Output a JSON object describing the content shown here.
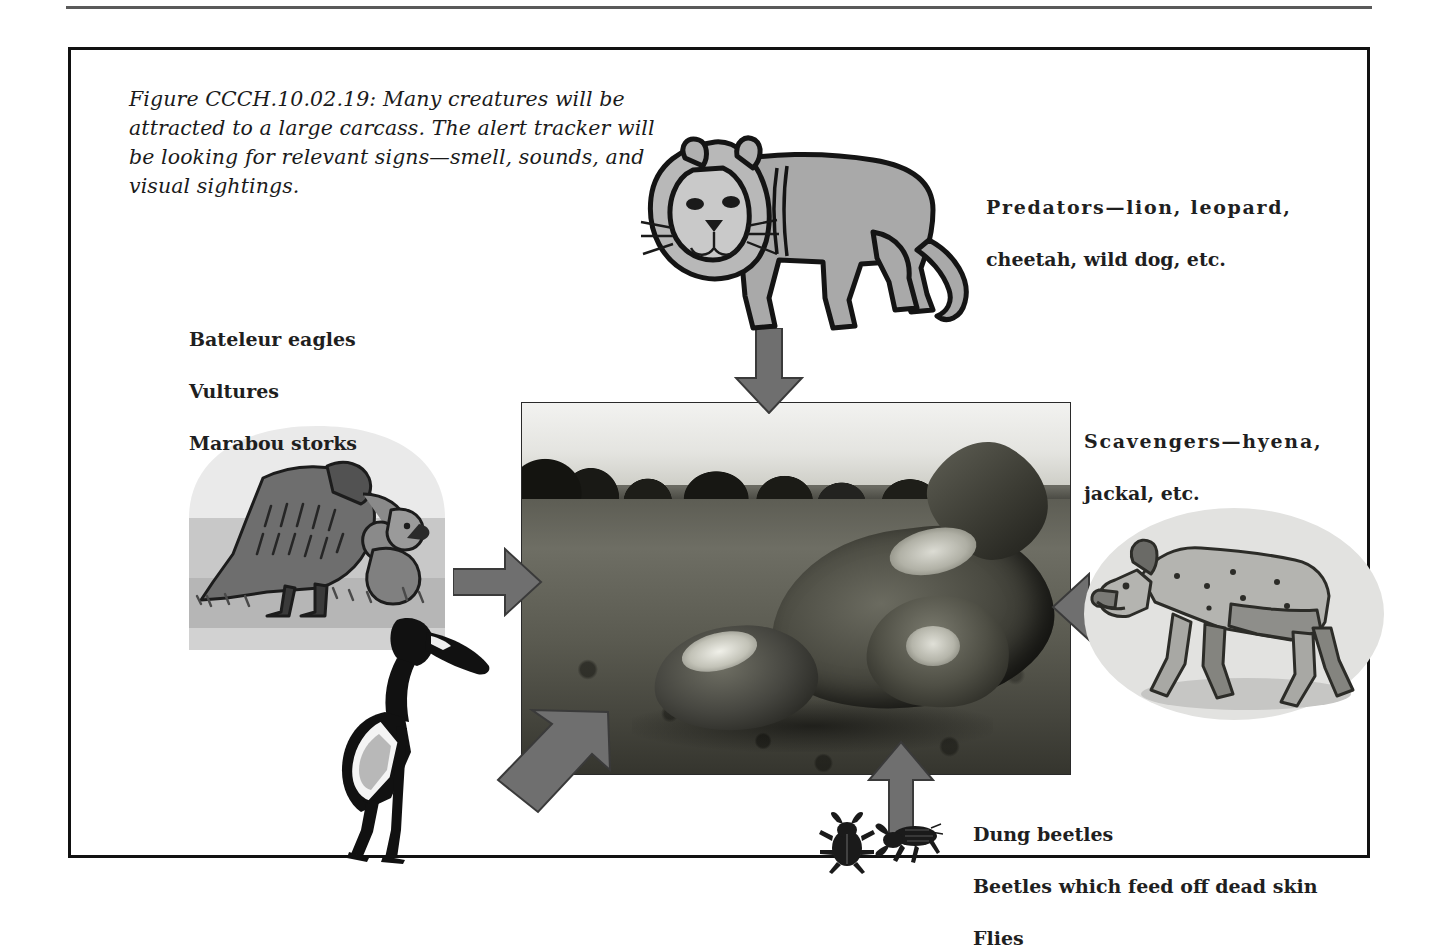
{
  "figure": {
    "caption": "Figure CCCH.10.02.19:  Many creatures will be attracted to a large carcass.  The alert tracker will be looking for relevant signs—smell, sounds, and visual sightings.",
    "frame_border_color": "#111111",
    "page_background": "#ffffff"
  },
  "labels": {
    "predators": {
      "lead": "Predators—lion, leopard,",
      "rest": "cheetah, wild dog, etc."
    },
    "scavengers": {
      "lead": "Scavengers—hyena,",
      "rest": "jackal, etc."
    },
    "birds": {
      "line1": "Bateleur eagles",
      "line2": "Vultures",
      "line3": "Marabou storks"
    },
    "insects": {
      "line1": "Dung beetles",
      "line2": "Beetles which feed off dead skin",
      "line3": "Flies"
    }
  },
  "photo": {
    "alt": "black-and-white photograph of a large animal carcass lying on open savanna with a distant treeline"
  },
  "arrows": {
    "color": "#6f6f6f",
    "outline": "#3a3a3a",
    "items": [
      {
        "name": "arrow-from-predators",
        "direction": "down"
      },
      {
        "name": "arrow-from-vultures",
        "direction": "right"
      },
      {
        "name": "arrow-from-scavengers",
        "direction": "left"
      },
      {
        "name": "arrow-from-insects",
        "direction": "up"
      },
      {
        "name": "arrow-from-storks",
        "direction": "up-right"
      }
    ]
  },
  "illustrations": {
    "lion": {
      "name": "lion-illustration",
      "fill": "#a9a9a9",
      "outline": "#141414"
    },
    "hyena": {
      "name": "hyena-illustration",
      "fill": "#b4b4b0",
      "outline": "#2c2c28",
      "backdrop": "#e2e2e0"
    },
    "vulture": {
      "name": "vulture-illustration",
      "fill": "#6e6e6e",
      "outline": "#1c1c1c",
      "backdrop": "#e9e9e9"
    },
    "stork": {
      "name": "marabou-stork-illustration",
      "fill": "#111111",
      "accent": "#ffffff"
    },
    "beetles": {
      "name": "beetles-illustration",
      "fill": "#1a1a1a"
    }
  },
  "colors": {
    "rule": "#5a5a5a",
    "text": "#1f1f1f",
    "caption_text": "#1a1a1a"
  }
}
